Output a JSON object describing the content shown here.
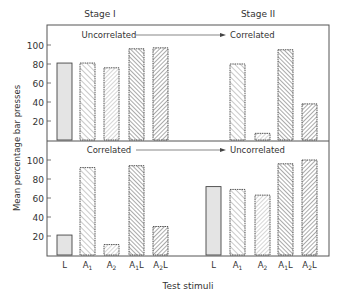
{
  "chart_data": [
    {
      "type": "bar",
      "panel": "top",
      "title": "",
      "stage_labels": [
        "Stage I",
        "Stage II"
      ],
      "annotation_left": "Uncorrelated",
      "annotation_right": "Correlated",
      "ylabel": "Mean percentage bar presses",
      "xlabel": "Test stimuli",
      "ylim": [
        0,
        110
      ],
      "yticks": [
        20,
        40,
        60,
        80,
        100
      ],
      "series": [
        {
          "name": "Stage I",
          "categories": [
            "L",
            "A1",
            "A2",
            "A1L",
            "A2L"
          ],
          "values": [
            81,
            81,
            76,
            96,
            97
          ]
        },
        {
          "name": "Stage II",
          "categories": [
            "L",
            "A1",
            "A2",
            "A1L",
            "A2L"
          ],
          "values": [
            null,
            80,
            7,
            95,
            38
          ]
        }
      ]
    },
    {
      "type": "bar",
      "panel": "bottom",
      "annotation_left": "Correlated",
      "annotation_right": "Uncorrelated",
      "ylabel": "Mean percentage bar presses",
      "xlabel": "Test stimuli",
      "ylim": [
        0,
        110
      ],
      "yticks": [
        20,
        40,
        60,
        80,
        100
      ],
      "series": [
        {
          "name": "Stage I",
          "categories": [
            "L",
            "A1",
            "A2",
            "A1L",
            "A2L"
          ],
          "values": [
            21,
            92,
            11,
            94,
            30
          ]
        },
        {
          "name": "Stage II",
          "categories": [
            "L",
            "A1",
            "A2",
            "A1L",
            "A2L"
          ],
          "values": [
            72,
            69,
            63,
            96,
            100
          ]
        }
      ]
    }
  ],
  "labels": {
    "stage1": "Stage I",
    "stage2": "Stage II",
    "top_left_note": "Uncorrelated",
    "top_right_note": "Correlated",
    "bottom_left_note": "Correlated",
    "bottom_right_note": "Uncorrelated",
    "ylabel": "Mean percentage bar presses",
    "xlabel": "Test stimuli",
    "ticks": [
      "20",
      "40",
      "60",
      "80",
      "100"
    ],
    "categories": [
      {
        "base": "L",
        "sub": "",
        "suffix": ""
      },
      {
        "base": "A",
        "sub": "1",
        "suffix": ""
      },
      {
        "base": "A",
        "sub": "2",
        "suffix": ""
      },
      {
        "base": "A",
        "sub": "1",
        "suffix": "L"
      },
      {
        "base": "A",
        "sub": "2",
        "suffix": "L"
      }
    ]
  },
  "colors": {
    "frame": "#555555",
    "bar_outline": "#444444",
    "L_fill": "#e4e4e4",
    "hatch": "#666666"
  }
}
